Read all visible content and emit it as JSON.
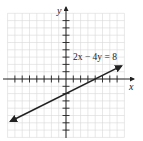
{
  "chart_data": {
    "type": "line",
    "title": "",
    "xlabel": "x",
    "ylabel": "y",
    "xlim": [
      -8,
      8
    ],
    "ylim": [
      -8,
      9
    ],
    "grid": true,
    "legend_position": "none",
    "annotations": [
      {
        "text": "2x − 4y = 8",
        "x": 1.5,
        "y": 3.2
      }
    ],
    "series": [
      {
        "name": "2x − 4y = 8",
        "equation": "y = x/2 − 2",
        "x": [
          -7.6,
          0,
          4,
          7.6
        ],
        "y": [
          -5.8,
          -2,
          0,
          1.8
        ],
        "arrows": "both",
        "color": "#222222"
      }
    ]
  },
  "labels": {
    "x_axis": "x",
    "y_axis": "y",
    "equation": "2x − 4y = 8"
  },
  "style": {
    "grid_color": "#d9d9d9",
    "axis_color": "#222222",
    "line_color": "#222222"
  }
}
